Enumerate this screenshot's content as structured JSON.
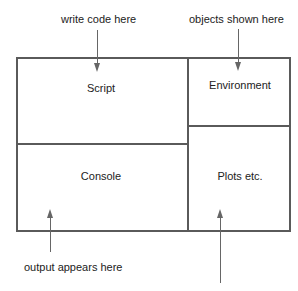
{
  "diagram": {
    "panes": {
      "script": "Script",
      "environment": "Environment",
      "console": "Console",
      "plots": "Plots etc."
    },
    "annotations": {
      "script": "write code here",
      "environment": "objects shown here",
      "console": "output appears here"
    },
    "colors": {
      "line": "#5a5a5a",
      "text": "#222222",
      "background": "#ffffff"
    }
  }
}
